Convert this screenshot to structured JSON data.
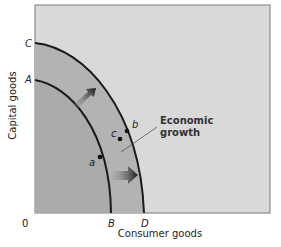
{
  "diagram": {
    "title": "",
    "type": "production-possibilities-frontier",
    "y_axis_label": "Capital goods",
    "x_axis_label": "Consumer goods",
    "origin_label": "0",
    "y_intercepts": [
      "C",
      "A"
    ],
    "x_intercepts": [
      "B",
      "D"
    ],
    "curves": [
      {
        "name": "inner PPF",
        "from": "A",
        "to": "B"
      },
      {
        "name": "outer PPF",
        "from": "C",
        "to": "D"
      }
    ],
    "points": [
      {
        "label": "a",
        "on": "inner PPF"
      },
      {
        "label": "b",
        "on": "outer PPF"
      },
      {
        "label": "c",
        "on": "between curves"
      }
    ],
    "annotation": {
      "line1": "Economic",
      "line2": "growth"
    },
    "arrows": [
      "shift outward (upper)",
      "shift outward (lower)"
    ],
    "colors": {
      "background_panel": "#d9d9d9",
      "shaded_region": "#b3b3b3",
      "curve": "#1a1a1a",
      "frame": "#8c8c8c"
    }
  }
}
